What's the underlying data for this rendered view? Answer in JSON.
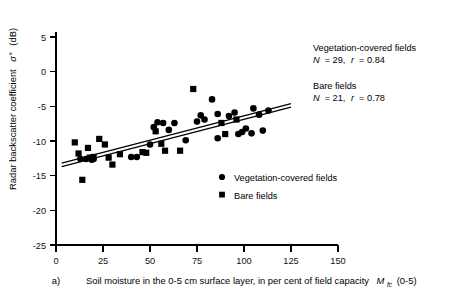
{
  "chart_data": {
    "type": "scatter",
    "title": "",
    "panel_label": "a)",
    "xlabel": "Soil moisture in the 0-5 cm surface layer, in per cent of field capacity",
    "xlabel_symbol": "M",
    "xlabel_subscript": "fc",
    "xlabel_suffix": "(0-5)",
    "ylabel": "Radar backscatter coefficient",
    "ylabel_symbol": "σ°",
    "ylabel_units": "(dB)",
    "xlim": [
      0,
      150
    ],
    "ylim": [
      -25,
      5
    ],
    "xticks": [
      0,
      25,
      50,
      75,
      100,
      125,
      150
    ],
    "yticks": [
      5,
      0,
      -5,
      -10,
      -15,
      -20,
      -25
    ],
    "xtick_labels": [
      "0",
      "25",
      "50",
      "75",
      "100",
      "125",
      "150"
    ],
    "ytick_labels": [
      "5",
      "0",
      "-5",
      "-10",
      "-15",
      "-20",
      "-25"
    ],
    "grid": false,
    "legend_position": "inside-lower-right",
    "series": [
      {
        "name": "Vegetation-covered fields",
        "marker": "circle",
        "color": "#000000",
        "N": 29,
        "r": 0.84,
        "points": [
          [
            13,
            -12.6
          ],
          [
            16,
            -12.6
          ],
          [
            19,
            -12.7
          ],
          [
            20,
            -12.6
          ],
          [
            40,
            -12.3
          ],
          [
            43,
            -12.3
          ],
          [
            50,
            -10.5
          ],
          [
            52,
            -8.0
          ],
          [
            54,
            -7.3
          ],
          [
            57,
            -7.4
          ],
          [
            60,
            -8.4
          ],
          [
            63,
            -7.4
          ],
          [
            75,
            -7.2
          ],
          [
            77,
            -6.3
          ],
          [
            79,
            -6.9
          ],
          [
            83,
            -4.0
          ],
          [
            86,
            -6.1
          ],
          [
            92,
            -6.4
          ],
          [
            95,
            -5.9
          ],
          [
            97,
            -9.0
          ],
          [
            99,
            -8.7
          ],
          [
            101,
            -8.2
          ],
          [
            104,
            -8.9
          ],
          [
            105,
            -5.3
          ],
          [
            108,
            -6.2
          ],
          [
            110,
            -8.5
          ],
          [
            113,
            -5.6
          ],
          [
            86,
            -9.6
          ],
          [
            69,
            -9.9
          ]
        ]
      },
      {
        "name": "Bare fields",
        "marker": "square",
        "color": "#000000",
        "N": 21,
        "r": 0.78,
        "points": [
          [
            10,
            -10.2
          ],
          [
            12,
            -11.8
          ],
          [
            14,
            -15.6
          ],
          [
            17,
            -11.0
          ],
          [
            18,
            -12.4
          ],
          [
            20,
            -12.3
          ],
          [
            23,
            -9.7
          ],
          [
            26,
            -10.5
          ],
          [
            28,
            -12.4
          ],
          [
            30,
            -13.4
          ],
          [
            34,
            -11.9
          ],
          [
            46,
            -11.6
          ],
          [
            48,
            -11.7
          ],
          [
            53,
            -8.6
          ],
          [
            56,
            -10.4
          ],
          [
            58,
            -11.4
          ],
          [
            66,
            -11.4
          ],
          [
            73,
            -2.5
          ],
          [
            88,
            -7.4
          ],
          [
            90,
            -9.0
          ],
          [
            96,
            -6.9
          ]
        ]
      }
    ],
    "fit_lines": [
      {
        "name": "Vegetation-covered fields",
        "x": [
          3,
          125
        ],
        "y": [
          -13.2,
          -4.6
        ]
      },
      {
        "name": "Bare fields",
        "x": [
          3,
          125
        ],
        "y": [
          -13.7,
          -5.1
        ]
      }
    ],
    "annotations": [
      {
        "id": "veg-annotation",
        "line1": "Vegetation-covered fields",
        "line2_symbol_n": "N",
        "line2_n_value": "= 29,",
        "line2_symbol_r": "r",
        "line2_r_value": "= 0.84"
      },
      {
        "id": "bare-annotation",
        "line1": "Bare fields",
        "line2_symbol_n": "N",
        "line2_n_value": "= 21,",
        "line2_symbol_r": "r",
        "line2_r_value": "= 0.78"
      }
    ],
    "legend": [
      {
        "marker": "circle",
        "label": "Vegetation-covered fields"
      },
      {
        "marker": "square",
        "label": "Bare fields"
      }
    ]
  }
}
